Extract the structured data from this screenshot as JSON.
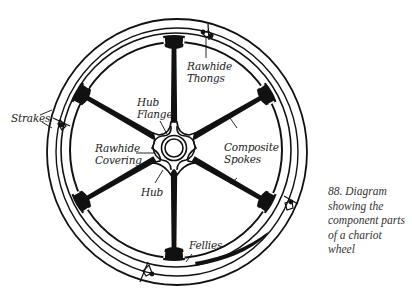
{
  "figure": {
    "caption_lines": [
      "88. Diagram",
      "showing the",
      "component parts",
      "of a chariot",
      "wheel"
    ],
    "colors": {
      "ink": "#111111",
      "label_text": "#222222",
      "background": "#ffffff"
    }
  },
  "labels": {
    "rawhide_thongs": [
      "Rawhide",
      "Thongs"
    ],
    "hub_flange": [
      "Hub",
      "Flange"
    ],
    "strakes": [
      "Strakes"
    ],
    "rawhide_covering": [
      "Rawhide",
      "Covering"
    ],
    "composite_spokes": [
      "Composite",
      "Spokes"
    ],
    "hub": [
      "Hub"
    ],
    "fellies": [
      "Fellies"
    ]
  },
  "wheel": {
    "spoke_count": 6,
    "components": [
      "Strakes",
      "Fellies",
      "Composite Spokes",
      "Hub Flange",
      "Rawhide Covering",
      "Hub",
      "Rawhide Thongs"
    ]
  }
}
